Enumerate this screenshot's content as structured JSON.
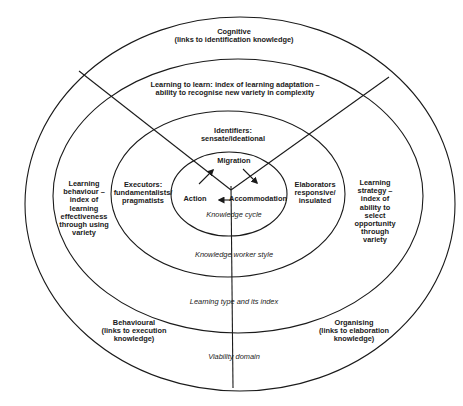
{
  "diagram": {
    "type": "concentric-ellipses",
    "stroke_color": "#1a1a1a",
    "background": "#ffffff",
    "rings": [
      {
        "id": "viability-domain",
        "label": "Viability domain"
      },
      {
        "id": "learning-type",
        "label": "Learning type and its index"
      },
      {
        "id": "knowledge-worker-style",
        "label": "Knowledge worker style"
      },
      {
        "id": "knowledge-cycle",
        "label": "Knowledge cycle"
      }
    ],
    "outer_ring": {
      "top": "Cognitive\n(links to identification knowledge)",
      "bottom_left": "Behavioural\n(links to execution\nknowledge)",
      "bottom_right": "Organising\n(links to elaboration\nknowledge)",
      "domain_label": "Viability domain"
    },
    "second_ring": {
      "top": "Learning to learn: index of learning adaptation –\nability to recognise new variety in complexity",
      "left": "Learning\nbehaviour –\nindex of\nlearning\neffectiveness\nthrough using\nvariety",
      "right": "Learning\nstrategy –\nindex of\nability to\nselect\nopportunity\nthrough\nvariety",
      "ring_label": "Learning type and its index"
    },
    "third_ring": {
      "top": "Identifiers:\nsensate/ideational",
      "left": "Executors:\nfundamentalists/\npragmatists",
      "right": "Elaborators\nresponsive/\ninsulated",
      "ring_label": "Knowledge worker style"
    },
    "inner_ring": {
      "top": "Migration",
      "left": "Action",
      "right": "Accommodation",
      "ring_label": "Knowledge cycle"
    },
    "arrows": [
      {
        "from": "Action",
        "to": "Migration",
        "direction": "up-right"
      },
      {
        "from": "Migration",
        "to": "Accommodation",
        "direction": "down-right"
      },
      {
        "from": "Accommodation",
        "to": "Action",
        "direction": "left"
      }
    ]
  }
}
